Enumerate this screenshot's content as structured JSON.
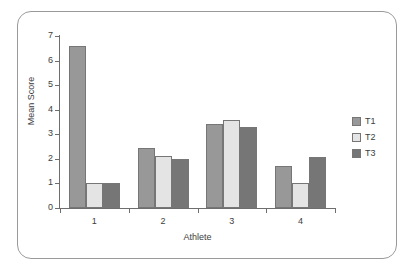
{
  "chart_data": {
    "type": "bar",
    "title": "",
    "subtitle": "",
    "xlabel": "Athlete",
    "ylabel": "Mean Score",
    "categories": [
      "1",
      "2",
      "3",
      "4"
    ],
    "ylim": [
      0,
      7
    ],
    "yticks": [
      0,
      1,
      2,
      3,
      4,
      5,
      6,
      7
    ],
    "ytick_labels": [
      "0",
      "1",
      "2",
      "3",
      "4",
      "5",
      "6",
      "7"
    ],
    "grid": false,
    "legend_position": "right",
    "series": [
      {
        "name": "T1",
        "color": "#989898",
        "values": [
          6.6,
          2.45,
          3.4,
          1.72
        ]
      },
      {
        "name": "T2",
        "color": "#e4e4e4",
        "values": [
          1.0,
          2.1,
          3.6,
          1.0
        ]
      },
      {
        "name": "T3",
        "color": "#767676",
        "values": [
          1.0,
          2.0,
          3.3,
          2.08
        ]
      }
    ]
  },
  "legend": {
    "entries": [
      {
        "label": "T1",
        "color": "#989898"
      },
      {
        "label": "T2",
        "color": "#e4e4e4"
      },
      {
        "label": "T3",
        "color": "#767676"
      }
    ]
  },
  "axes": {
    "y_label": "Mean Score",
    "x_label": "Athlete"
  },
  "colors": {
    "frame": "#9a9a9a",
    "axis": "#6e6e6e",
    "text": "#3d3d3d",
    "background": "#ffffff"
  }
}
